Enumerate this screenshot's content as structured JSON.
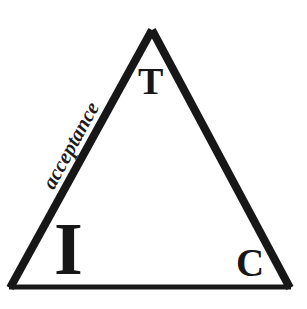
{
  "diagram": {
    "background_color": "#ffffff",
    "stroke_color": "#171717",
    "vertices": {
      "apex": {
        "x": 152,
        "y": 30
      },
      "bottom_left": {
        "x": 10,
        "y": 288
      },
      "bottom_right": {
        "x": 290,
        "y": 288
      }
    },
    "edges": [
      {
        "name": "left-edge",
        "from": "bottom_left",
        "to": "apex",
        "thickness": 8,
        "label": "acceptance"
      },
      {
        "name": "right-edge",
        "from": "apex",
        "to": "bottom_right",
        "thickness": 8,
        "label": ""
      },
      {
        "name": "bottom-edge",
        "from": "bottom_left",
        "to": "bottom_right",
        "thickness": 5,
        "label": ""
      }
    ],
    "corner_labels": {
      "apex": "T",
      "bottom_left": "I",
      "bottom_right": "C"
    },
    "edge_labels": {
      "left": "acceptance"
    }
  }
}
